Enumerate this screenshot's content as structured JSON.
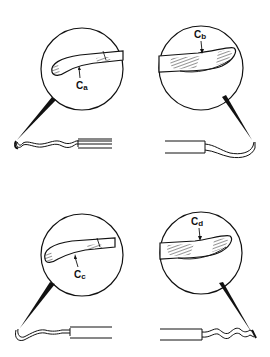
{
  "figure": {
    "panels": [
      {
        "id": "a",
        "label_main": "C",
        "label_sub": "a",
        "position": "top-left"
      },
      {
        "id": "b",
        "label_main": "C",
        "label_sub": "b",
        "position": "top-right"
      },
      {
        "id": "c",
        "label_main": "C",
        "label_sub": "c",
        "position": "bottom-left"
      },
      {
        "id": "d",
        "label_main": "C",
        "label_sub": "d",
        "position": "bottom-right"
      }
    ],
    "colors": {
      "ink": "#111111",
      "background": "#ffffff"
    }
  }
}
